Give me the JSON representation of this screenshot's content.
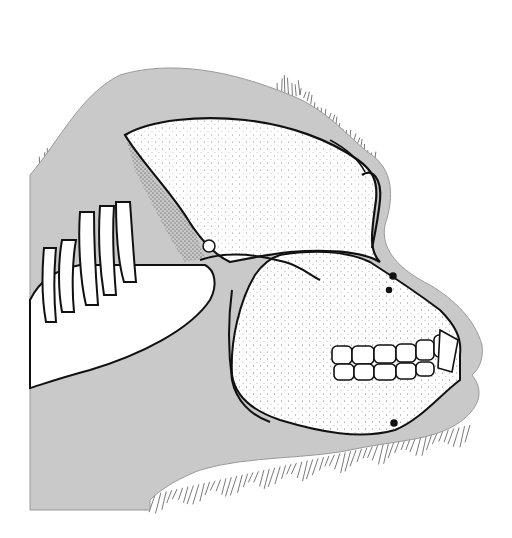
{
  "figure": {
    "title": "Lateral view of great ape skull in situ",
    "alt": "Scientific stipple illustration of a gorilla skull shown in profile inside the head outline, with cervical vertebrae, grey soft-tissue silhouette and fringe of hair"
  },
  "colors": {
    "background": "#ffffff",
    "soft_tissue": "#c9c9c9",
    "bone": "#ffffff",
    "ink": "#111111",
    "hair": "#6a6a6a",
    "stipple": "#333333"
  },
  "shapes": {
    "tissue": "M30,175 C60,140 80,95 120,75 C170,60 230,70 290,95 C330,110 355,145 372,155 C392,170 395,195 385,225 C380,250 400,270 430,285 C455,300 475,320 482,345 C484,360 478,370 472,375 C484,390 480,405 465,418 C440,440 400,440 360,448 C310,460 250,455 200,470 C175,480 160,490 150,500 L150,510 L30,510 Z",
    "cranium": "M125,135 C150,120 200,115 245,120 C290,125 330,140 358,160 C372,170 378,180 376,200 C372,230 368,250 380,262 C360,250 320,250 290,252 C270,254 250,258 230,262 C215,255 200,240 185,215 C165,185 140,160 125,135 Z",
    "face": "M280,255 C310,250 345,250 370,262 C395,278 420,295 440,310 C455,325 462,338 460,355 L460,380 C440,395 420,420 395,430 C360,440 320,432 280,420 C250,410 235,395 232,375 C230,340 240,300 255,275 C262,265 270,258 280,255 Z",
    "mandible_line": "M232,290 C228,320 228,350 232,380 C236,400 250,415 270,422",
    "orbit_outline": "M362,175 C372,168 382,178 380,200 C378,220 374,238 372,248",
    "brow": "M330,140 C345,148 358,158 365,172",
    "zygomatic": "M200,260 C230,250 260,255 285,262 C300,266 310,275 320,280",
    "ear_hole": {
      "cx": 209,
      "cy": 246,
      "r": 6
    },
    "mental_foramen": {
      "cx": 394,
      "cy": 423,
      "r": 3
    },
    "infraorbital_foramina": [
      {
        "cx": 393,
        "cy": 276,
        "r": 3
      },
      {
        "cx": 389,
        "cy": 290,
        "r": 2.5
      }
    ],
    "neck_block": "M30,300 C40,280 55,270 80,265 L205,265 C215,270 218,285 210,300 C190,330 140,355 90,370 C60,378 40,385 30,388 Z",
    "vertebrae_spines": [
      "M44,248 C42,270 42,300 46,322 L56,322 C54,300 54,270 56,248 Z",
      "M62,240 C58,262 58,290 62,312 L74,312 C72,292 72,262 76,240 Z",
      "M80,212 C78,240 80,280 86,305 L98,305 C96,280 94,240 94,212 Z",
      "M100,206 C98,236 100,270 104,295 L116,295 C114,270 112,236 114,206 Z",
      "M116,202 C116,230 118,262 124,282 L136,282 C134,262 132,230 130,202 Z"
    ],
    "teeth_upper": [
      [
        332,
        346,
        20,
        18
      ],
      [
        352,
        346,
        22,
        18
      ],
      [
        374,
        345,
        22,
        18
      ],
      [
        396,
        344,
        20,
        18
      ],
      [
        416,
        340,
        18,
        20
      ],
      [
        434,
        335,
        14,
        22
      ]
    ],
    "teeth_lower": [
      [
        334,
        364,
        20,
        16
      ],
      [
        354,
        364,
        20,
        16
      ],
      [
        374,
        364,
        22,
        16
      ],
      [
        396,
        363,
        20,
        16
      ],
      [
        416,
        362,
        18,
        14
      ]
    ],
    "hair_regions": [
      {
        "from": [
          40,
          175
        ],
        "to": [
          300,
          95
        ],
        "count": 70,
        "len": 26,
        "angle": -70
      },
      {
        "from": [
          300,
          95
        ],
        "to": [
          375,
          160
        ],
        "count": 22,
        "len": 18,
        "angle": -30
      },
      {
        "from": [
          150,
          495
        ],
        "to": [
          470,
          425
        ],
        "count": 60,
        "len": 22,
        "angle": 110
      }
    ]
  }
}
